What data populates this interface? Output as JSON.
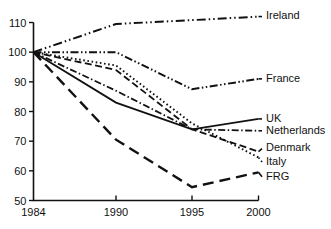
{
  "chart_data": {
    "type": "line",
    "title": "",
    "subtitle": "",
    "xlabel": "",
    "ylabel": "",
    "x": [
      1984,
      1990,
      1995,
      2000
    ],
    "x_tick_labels": [
      "1984",
      "1990",
      "1995",
      "2000"
    ],
    "y_tick_labels": [
      "50",
      "60",
      "70",
      "80",
      "90",
      "100",
      "110"
    ],
    "y_ticks": [
      50,
      60,
      70,
      80,
      90,
      100,
      110
    ],
    "ylim": [
      50,
      110
    ],
    "grid": false,
    "legend_position": "right-inline-labels",
    "index_base": 100,
    "series": [
      {
        "name": "Ireland",
        "label": "Ireland",
        "style": "dash-dot-dot",
        "dasharray": "9,3,1.5,3,1.5,3",
        "width": 2.0,
        "values": [
          100,
          109.5,
          110.8,
          112.0
        ],
        "label_y": 112.0
      },
      {
        "name": "France",
        "label": "France",
        "style": "dash-dot-dot",
        "dasharray": "8,2.5,1.5,2.5,1.5,2.5",
        "width": 2.0,
        "values": [
          100,
          100.0,
          87.5,
          91.0
        ],
        "label_y": 91.0
      },
      {
        "name": "UK",
        "label": "UK",
        "style": "solid",
        "dasharray": "0",
        "width": 1.8,
        "values": [
          100,
          83.0,
          74.0,
          77.5
        ],
        "label_y": 77.5
      },
      {
        "name": "Netherlands",
        "label": "Netherlands",
        "style": "dash-dot",
        "dasharray": "7,2.5,1.5,2.5",
        "width": 1.8,
        "values": [
          100,
          87.0,
          74.0,
          73.5
        ],
        "label_y": 73.5
      },
      {
        "name": "Denmark",
        "label": "Denmark",
        "style": "dashed",
        "dasharray": "7,3.5",
        "width": 1.8,
        "values": [
          100,
          94.0,
          74.0,
          66.5
        ],
        "label_y": 67.5
      },
      {
        "name": "Italy",
        "label": "Italy",
        "style": "dotted",
        "dasharray": "1.6,2.6",
        "width": 1.9,
        "values": [
          100,
          95.5,
          76.0,
          64.5
        ],
        "label_y": 63.0
      },
      {
        "name": "FRG",
        "label": "FRG",
        "style": "long-dash",
        "dasharray": "11,6",
        "width": 2.4,
        "values": [
          100,
          70.5,
          54.5,
          59.5
        ],
        "label_y": 58.0
      }
    ]
  },
  "axes": {
    "y_axis_name": "y-axis",
    "x_axis_name": "x-axis"
  }
}
